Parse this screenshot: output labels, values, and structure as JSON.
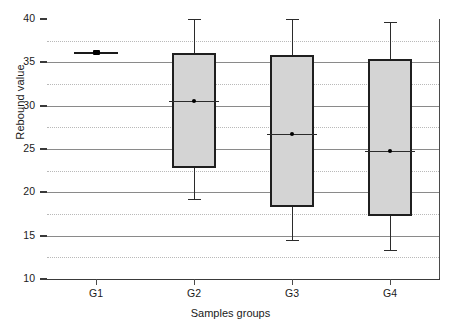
{
  "chart_data": {
    "type": "box",
    "title": "",
    "xlabel": "Samples groups",
    "ylabel": "Rebound value",
    "categories": [
      "G1",
      "G2",
      "G3",
      "G4"
    ],
    "ylim": [
      10,
      40
    ],
    "ytick_labels": [
      "40",
      "35",
      "30",
      "25",
      "20",
      "15",
      "10"
    ],
    "ytick_values": [
      40,
      35,
      30,
      25,
      20,
      15,
      10
    ],
    "minor_gridline_values": [
      37.5,
      32.5,
      27.5,
      22.5,
      17.5,
      12.5
    ],
    "grid": "major solid, minor dotted",
    "legend": "none",
    "boxes": [
      {
        "category": "G1",
        "whisker_low": 36.1,
        "q1": 36.1,
        "median": 36.1,
        "q3": 36.1,
        "whisker_high": 36.1,
        "degenerate": true,
        "note": "single value, rendered as flat line"
      },
      {
        "category": "G2",
        "whisker_low": 19.2,
        "q1": 22.8,
        "median": 30.5,
        "q3": 36.1,
        "whisker_high": 40.0,
        "degenerate": false
      },
      {
        "category": "G3",
        "whisker_low": 14.5,
        "q1": 18.3,
        "median": 26.7,
        "q3": 35.8,
        "whisker_high": 40.0,
        "degenerate": false
      },
      {
        "category": "G4",
        "whisker_low": 13.3,
        "q1": 17.3,
        "median": 24.8,
        "q3": 35.4,
        "whisker_high": 39.7,
        "degenerate": false
      }
    ],
    "colors": {
      "box_fill": "#d4d4d4",
      "box_border": "#1f1f1f",
      "whisker": "#2b2b2b",
      "axis": "#3a3a3a",
      "grid_major": "#8a8a8a",
      "grid_minor": "#b9b9b9",
      "text": "#1a1a1a",
      "background": "#ffffff"
    }
  }
}
